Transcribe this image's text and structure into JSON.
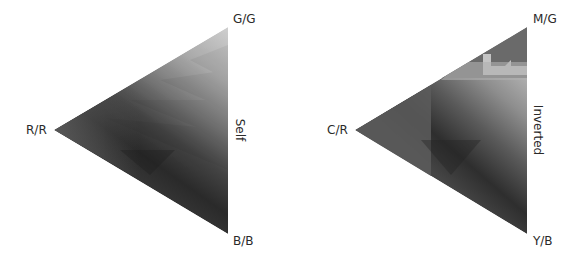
{
  "panels": [
    {
      "title": "Self",
      "vertices": {
        "top": "G/G",
        "left": "R/R",
        "bottom": "B/B"
      },
      "colors": {
        "top": "#cdcdcd",
        "left": "#555555",
        "bottom": "#3c3c3c",
        "center_dark": "#262626"
      }
    },
    {
      "title": "Inverted",
      "vertices": {
        "top": "M/G",
        "left": "C/R",
        "bottom": "Y/B"
      },
      "colors": {
        "top": "#6a6a6a",
        "left": "#5a5a5a",
        "bottom": "#454545",
        "center_dark": "#2c2c2c",
        "band_light": "#c2c2c2"
      }
    }
  ]
}
